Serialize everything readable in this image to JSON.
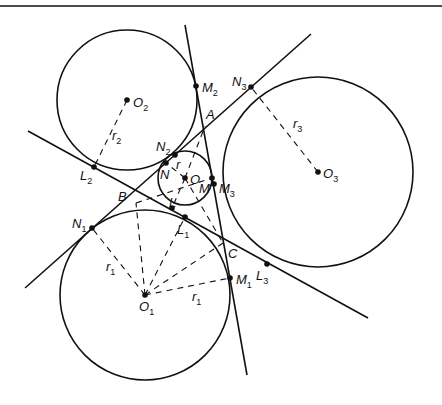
{
  "diagram": {
    "type": "geometry",
    "rule": {
      "y": 6
    },
    "circles": [
      {
        "id": "O2",
        "cx": 127,
        "cy": 100,
        "r": 70
      },
      {
        "id": "O3",
        "cx": 318,
        "cy": 172,
        "r": 95
      },
      {
        "id": "O1",
        "cx": 145,
        "cy": 295,
        "r": 85
      },
      {
        "id": "O",
        "cx": 185,
        "cy": 178,
        "r": 27
      }
    ],
    "lines": [
      {
        "id": "line-through-M2-M3-M1",
        "x1": 185,
        "y1": 25,
        "x2": 247,
        "y2": 375
      },
      {
        "id": "line-through-N1-N2-N3",
        "x1": 25,
        "y1": 288,
        "x2": 311,
        "y2": 34
      },
      {
        "id": "line-through-L2-L1-L3",
        "x1": 28,
        "y1": 131,
        "x2": 368,
        "y2": 318
      }
    ],
    "points": [
      {
        "id": "O2",
        "x": 127,
        "y": 100
      },
      {
        "id": "O3",
        "x": 318,
        "y": 172
      },
      {
        "id": "O1",
        "x": 145,
        "y": 295
      },
      {
        "id": "O",
        "x": 185,
        "y": 178
      },
      {
        "id": "M2",
        "x": 196,
        "y": 86
      },
      {
        "id": "N3",
        "x": 251,
        "y": 87
      },
      {
        "id": "L2",
        "x": 94,
        "y": 167
      },
      {
        "id": "N2",
        "x": 175,
        "y": 155
      },
      {
        "id": "N",
        "x": 166,
        "y": 163
      },
      {
        "id": "M",
        "x": 212,
        "y": 178
      },
      {
        "id": "M3",
        "x": 214,
        "y": 184
      },
      {
        "id": "L",
        "x": 172,
        "y": 208
      },
      {
        "id": "L1",
        "x": 185,
        "y": 217
      },
      {
        "id": "N1",
        "x": 92,
        "y": 228
      },
      {
        "id": "M1",
        "x": 230,
        "y": 278
      },
      {
        "id": "L3",
        "x": 267,
        "y": 264
      }
    ],
    "radii_segments": [
      {
        "from": "O2",
        "to": "L2",
        "label": "r2"
      },
      {
        "from": "O3",
        "to": "N3",
        "label": "r3"
      },
      {
        "from": "O1",
        "to": "N1",
        "label": "r1"
      },
      {
        "from": "O1",
        "to": "M1",
        "label": "r1"
      },
      {
        "from": "O",
        "to": "N",
        "label": "r"
      }
    ],
    "labels": {
      "O2": {
        "main": "O",
        "sub": "2"
      },
      "O3": {
        "main": "O",
        "sub": "3"
      },
      "O1": {
        "main": "O",
        "sub": "1"
      },
      "O": {
        "main": "O"
      },
      "M2": {
        "main": "M",
        "sub": "2"
      },
      "N3": {
        "main": "N",
        "sub": "3"
      },
      "A": {
        "main": "A"
      },
      "B": {
        "main": "B"
      },
      "C": {
        "main": "C"
      },
      "L2": {
        "main": "L",
        "sub": "2"
      },
      "N2": {
        "main": "N",
        "sub": "2"
      },
      "N": {
        "main": "N"
      },
      "r": {
        "main": "r"
      },
      "M": {
        "main": "M"
      },
      "M3": {
        "main": "M",
        "sub": "3"
      },
      "L": {
        "main": "L"
      },
      "L1": {
        "main": "L",
        "sub": "1"
      },
      "N1": {
        "main": "N",
        "sub": "1"
      },
      "M1": {
        "main": "M",
        "sub": "1"
      },
      "L3": {
        "main": "L",
        "sub": "3"
      },
      "r1a": {
        "main": "r",
        "sub": "1"
      },
      "r1b": {
        "main": "r",
        "sub": "1"
      },
      "r2": {
        "main": "r",
        "sub": "2"
      },
      "r3": {
        "main": "r",
        "sub": "3"
      }
    }
  }
}
